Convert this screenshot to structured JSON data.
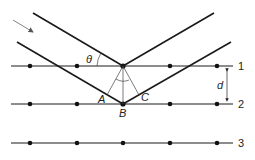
{
  "diagram": {
    "type": "bragg-diffraction",
    "labels": {
      "theta": "θ",
      "spacing": "d",
      "point_a": "A",
      "point_b": "B",
      "point_c": "C",
      "plane_1": "1",
      "plane_2": "2",
      "plane_3": "3"
    },
    "planes": [
      {
        "id": "1",
        "y": 66
      },
      {
        "id": "2",
        "y": 104
      },
      {
        "id": "3",
        "y": 143
      }
    ],
    "atom_x": [
      30,
      77,
      123,
      170,
      217
    ],
    "colors": {
      "line": "#1a1a1a",
      "arrow": "#777777"
    }
  }
}
